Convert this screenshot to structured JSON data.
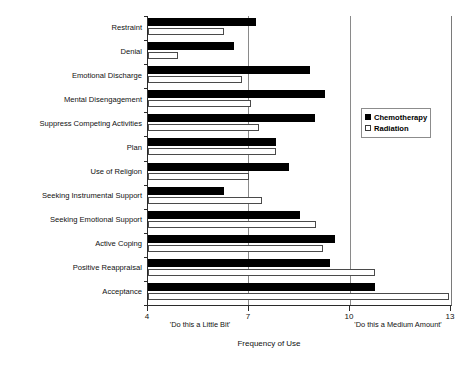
{
  "chart_data": {
    "type": "bar",
    "orientation": "horizontal",
    "title": "",
    "xlabel": "Frequency of Use",
    "ylabel": "",
    "xlim": [
      4,
      13
    ],
    "xticks": [
      4,
      7,
      10,
      13
    ],
    "xtick_labels": [
      "4",
      "7",
      "10",
      "13"
    ],
    "grid": "vertical gridlines at 7 and 10",
    "legend_position": "inside upper right",
    "categories": [
      "Restraint",
      "Denial",
      "Emotional Discharge",
      "Mental Disengagement",
      "Suppress Competing Activities",
      "Plan",
      "Use of Religion",
      "Seeking Instrumental Support",
      "Seeking Emotional Support",
      "Active Coping",
      "Positive Reappraisal",
      "Acceptance"
    ],
    "series": [
      {
        "name": "Chemotherapy",
        "style": "filled-black",
        "values": [
          7.2,
          6.55,
          8.8,
          9.25,
          8.95,
          7.8,
          8.2,
          6.25,
          8.5,
          9.55,
          9.4,
          10.75
        ]
      },
      {
        "name": "Radiation",
        "style": "open-white",
        "values": [
          6.25,
          4.9,
          6.8,
          7.05,
          7.3,
          7.8,
          7.0,
          7.4,
          9.0,
          9.2,
          10.75,
          12.95
        ]
      }
    ],
    "annotations": [
      {
        "name": "low-anchor",
        "text": "'Do this a Little Bit'",
        "at_x": 4.6
      },
      {
        "name": "high-anchor",
        "text": "'Do this a Medium Amount'",
        "at_x": 11.4
      }
    ]
  },
  "legend": {
    "items": [
      {
        "label": "Chemotherapy",
        "swatch": "filled-square-icon"
      },
      {
        "label": "Radiation",
        "swatch": "open-square-icon"
      }
    ]
  }
}
